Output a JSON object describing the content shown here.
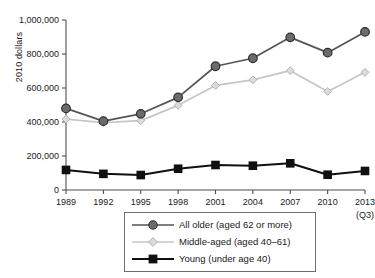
{
  "chart_data": {
    "type": "line",
    "title": "",
    "subtitle": "",
    "xlabel": "",
    "ylabel": "2010 dollars",
    "x_note": "(Q3)",
    "categories": [
      "1989",
      "1992",
      "1995",
      "1998",
      "2001",
      "2004",
      "2007",
      "2010",
      "2013"
    ],
    "xlim": [
      0,
      8
    ],
    "ylim": [
      0,
      1000000
    ],
    "ytick_labels": [
      "0",
      "200,000",
      "400,000",
      "600,000",
      "800,000",
      "1,000,000"
    ],
    "ytick_values": [
      0,
      200000,
      400000,
      600000,
      800000,
      1000000
    ],
    "grid": false,
    "legend_position": "bottom",
    "series": [
      {
        "name": "All older (aged 62 or more)",
        "marker": "circle",
        "color": "#555555",
        "marker_fill": "#6b6b6b",
        "values": [
          480000,
          405000,
          448000,
          545000,
          728000,
          775000,
          898000,
          808000,
          930000
        ]
      },
      {
        "name": "Middle-aged (aged 40–61)",
        "marker": "diamond",
        "color": "#c6c6c6",
        "marker_fill": "#d8d8d8",
        "values": [
          417000,
          396000,
          408000,
          498000,
          615000,
          648000,
          702000,
          580000,
          692000
        ]
      },
      {
        "name": "Young (under age 40)",
        "marker": "square",
        "color": "#101010",
        "marker_fill": "#101010",
        "values": [
          118000,
          95000,
          88000,
          125000,
          147000,
          143000,
          157000,
          90000,
          112000
        ]
      }
    ]
  },
  "axis": {
    "line_color": "#4d4d4d"
  }
}
